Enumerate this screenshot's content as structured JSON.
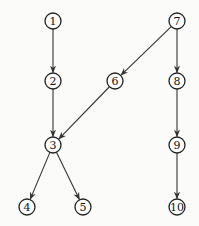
{
  "diagram": {
    "type": "directed-graph",
    "node_radius": 8,
    "colors": {
      "stroke": "#222222",
      "edge": "#333333",
      "background": "#fbfbfa"
    },
    "nodes": [
      {
        "id": "1",
        "label": "1",
        "x": 53,
        "y": 21
      },
      {
        "id": "2",
        "label": "2",
        "x": 53,
        "y": 81
      },
      {
        "id": "3",
        "label": "3",
        "x": 53,
        "y": 145
      },
      {
        "id": "4",
        "label": "4",
        "x": 27,
        "y": 207
      },
      {
        "id": "5",
        "label": "5",
        "x": 83,
        "y": 207
      },
      {
        "id": "6",
        "label": "6",
        "x": 115,
        "y": 81
      },
      {
        "id": "7",
        "label": "7",
        "x": 177,
        "y": 21
      },
      {
        "id": "8",
        "label": "8",
        "x": 177,
        "y": 81
      },
      {
        "id": "9",
        "label": "9",
        "x": 177,
        "y": 145
      },
      {
        "id": "10",
        "label": "10",
        "x": 177,
        "y": 207
      }
    ],
    "edges": [
      {
        "from": "1",
        "to": "2"
      },
      {
        "from": "2",
        "to": "3"
      },
      {
        "from": "6",
        "to": "3"
      },
      {
        "from": "3",
        "to": "4"
      },
      {
        "from": "3",
        "to": "5"
      },
      {
        "from": "7",
        "to": "6"
      },
      {
        "from": "7",
        "to": "8"
      },
      {
        "from": "8",
        "to": "9"
      },
      {
        "from": "9",
        "to": "10"
      }
    ]
  }
}
